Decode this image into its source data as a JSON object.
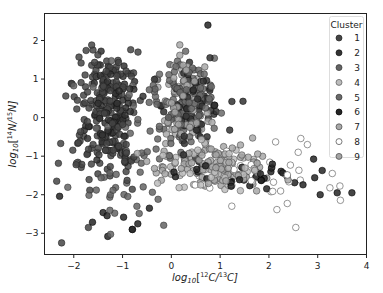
{
  "chart_data": {
    "type": "scatter",
    "title": "",
    "xlabel": "log10[12C/13C]",
    "ylabel": "log10[14N/15N]",
    "xlabel_parts": {
      "pre": "log",
      "sub": "10",
      "mid1": "[",
      "sup1": "12",
      "mid2": "C/",
      "sup2": "13",
      "post": "C]"
    },
    "ylabel_parts": {
      "pre": "log",
      "sub": "10",
      "mid1": "[",
      "sup1": "14",
      "mid2": "N/",
      "sup2": "15",
      "post": "N]"
    },
    "xlim": [
      -2.6,
      4.0
    ],
    "ylim": [
      -3.55,
      2.7
    ],
    "xticks": [
      -2,
      -1,
      0,
      1,
      2,
      3,
      4
    ],
    "xtick_labels": [
      "−2",
      "−1",
      "0",
      "1",
      "2",
      "3",
      "4"
    ],
    "yticks": [
      -3,
      -2,
      -1,
      0,
      1,
      2
    ],
    "ytick_labels": [
      "−3",
      "−2",
      "−1",
      "0",
      "1",
      "2"
    ],
    "grid": false,
    "legend": {
      "title": "Cluster",
      "position": "upper right",
      "entries": [
        "1",
        "2",
        "3",
        "4",
        "5",
        "6",
        "7",
        "8",
        "9"
      ]
    },
    "series": [
      {
        "name": "1",
        "color": "#454545",
        "edge": "#222222",
        "clusters": [
          {
            "cx": -1.35,
            "cy": 0.7,
            "sx": 0.3,
            "sy": 0.6,
            "n": 110,
            "seed": 11
          },
          {
            "cx": -1.45,
            "cy": -0.8,
            "sx": 0.35,
            "sy": 0.45,
            "n": 70,
            "seed": 12
          }
        ]
      },
      {
        "name": "2",
        "color": "#333333",
        "edge": "#111111",
        "clusters": [
          {
            "cx": -1.2,
            "cy": 0.2,
            "sx": 0.25,
            "sy": 0.7,
            "n": 80,
            "seed": 21
          },
          {
            "cx": 0.45,
            "cy": 0.3,
            "sx": 0.3,
            "sy": 0.55,
            "n": 70,
            "seed": 22
          }
        ]
      },
      {
        "name": "3",
        "color": "#646464",
        "edge": "#333333",
        "clusters": [
          {
            "cx": -0.6,
            "cy": -0.3,
            "sx": 0.6,
            "sy": 0.8,
            "n": 55,
            "seed": 31
          },
          {
            "cx": -1.2,
            "cy": -2.1,
            "sx": 0.5,
            "sy": 0.5,
            "n": 20,
            "seed": 32
          }
        ]
      },
      {
        "name": "4",
        "color": "#bcbcbc",
        "edge": "#555555",
        "clusters": [
          {
            "cx": 0.9,
            "cy": -1.35,
            "sx": 0.5,
            "sy": 0.3,
            "n": 55,
            "seed": 41
          }
        ]
      },
      {
        "name": "5",
        "color": "#6a6a6a",
        "edge": "#333333",
        "clusters": [
          {
            "cx": 0.3,
            "cy": 0.5,
            "sx": 0.3,
            "sy": 0.6,
            "n": 120,
            "seed": 51
          }
        ]
      },
      {
        "name": "6",
        "color": "#242424",
        "edge": "#000000",
        "clusters": [
          {
            "cx": 1.5,
            "cy": -1.45,
            "sx": 0.8,
            "sy": 0.25,
            "n": 35,
            "seed": 61
          },
          {
            "cx": -1.3,
            "cy": -2.6,
            "sx": 0.5,
            "sy": 0.4,
            "n": 8,
            "seed": 62
          }
        ]
      },
      {
        "name": "7",
        "color": "#a8a8a8",
        "edge": "#444444",
        "clusters": [
          {
            "cx": 0.3,
            "cy": 0.4,
            "sx": 0.25,
            "sy": 0.55,
            "n": 90,
            "seed": 71
          },
          {
            "cx": 1.2,
            "cy": -1.2,
            "sx": 0.55,
            "sy": 0.3,
            "n": 40,
            "seed": 72
          }
        ]
      },
      {
        "name": "8",
        "color": "#ffffff",
        "edge": "#444444",
        "clusters": [
          {
            "cx": 1.9,
            "cy": -1.6,
            "sx": 0.7,
            "sy": 0.45,
            "n": 35,
            "seed": 81
          }
        ]
      },
      {
        "name": "9",
        "color": "#a4a4a4",
        "edge": "#444444",
        "clusters": [
          {
            "cx": 0.7,
            "cy": -1.3,
            "sx": 0.6,
            "sy": 0.3,
            "n": 60,
            "seed": 91
          }
        ]
      }
    ],
    "outliers": [
      {
        "x": 0.75,
        "y": 2.4,
        "series": "6"
      },
      {
        "x": -2.25,
        "y": -3.25,
        "series": "1"
      },
      {
        "x": 3.7,
        "y": -1.95,
        "series": "6"
      },
      {
        "x": 3.4,
        "y": -1.95,
        "series": "6"
      },
      {
        "x": 3.05,
        "y": -2.0,
        "series": "6"
      },
      {
        "x": 2.55,
        "y": -2.85,
        "series": "8"
      },
      {
        "x": 3.3,
        "y": -1.45,
        "series": "8"
      },
      {
        "x": 2.6,
        "y": -0.9,
        "series": "8"
      },
      {
        "x": -2.35,
        "y": -1.65,
        "series": "1"
      },
      {
        "x": -1.7,
        "y": -2.85,
        "series": "1"
      },
      {
        "x": -0.8,
        "y": -2.9,
        "series": "1"
      },
      {
        "x": -0.45,
        "y": -2.35,
        "series": "6"
      },
      {
        "x": 0.5,
        "y": -1.05,
        "series": "1"
      }
    ]
  }
}
